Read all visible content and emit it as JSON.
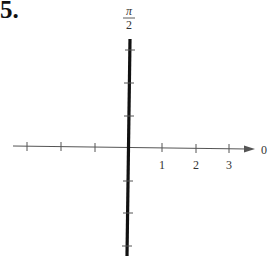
{
  "problem": {
    "number": "5."
  },
  "polar_axis": {
    "angle_label_top_numerator": "π",
    "angle_label_top_denominator": "2",
    "angle_label_right": "0",
    "radial_tick_labels": [
      "1",
      "2",
      "3"
    ]
  },
  "graph": {
    "description": "Polar graph of the vertical line θ = π/2 (bold line along the π/2 axis)",
    "line_color": "#111111",
    "axis_color": "#555555"
  }
}
